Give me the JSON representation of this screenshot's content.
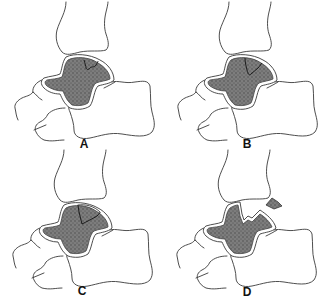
{
  "figure": {
    "panels": [
      {
        "id": "A",
        "label": "A",
        "stage": "compression / subchondral crack"
      },
      {
        "id": "B",
        "label": "B",
        "stage": "partially detached fragment"
      },
      {
        "id": "C",
        "label": "C",
        "stage": "completely detached, non-displaced fragment"
      },
      {
        "id": "D",
        "label": "D",
        "stage": "detached and displaced fragment"
      }
    ],
    "colors": {
      "bone_outline": "#3a3a3a",
      "talus_fill": "#6e6e6e",
      "background": "#ffffff"
    }
  }
}
